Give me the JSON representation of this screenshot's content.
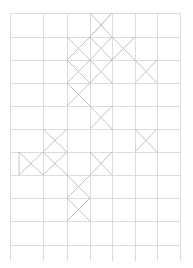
{
  "document": {
    "kind": "grid-pattern-diagram",
    "description": "Faint rectangular grid with diagonal X marks filling selected cells",
    "width": 193,
    "height": 268,
    "background_color": "#ffffff"
  },
  "grid": {
    "line_color": "#d8d8d8",
    "line_width": 0.9,
    "x_positions": [
      10,
      43,
      67,
      90,
      112,
      135,
      157,
      180
    ],
    "y_positions": [
      13,
      37,
      60,
      83,
      106,
      129,
      152,
      175,
      198,
      221,
      245
    ],
    "columns": 7,
    "rows": 10,
    "cell_width_avg": 24,
    "cell_height_avg": 23
  },
  "marks": {
    "diagonal_color": "#bcbcbc",
    "diagonal_width": 0.9,
    "dotted_color": "#b0b0b0",
    "legend_x": "full-x-cell",
    "legend_half": "single-diagonal-cell",
    "legend_triangle": "triangle-cell",
    "cells_full_x": [
      {
        "col": 3,
        "row": 0
      },
      {
        "col": 2,
        "row": 1
      },
      {
        "col": 3,
        "row": 1
      },
      {
        "col": 4,
        "row": 1
      },
      {
        "col": 2,
        "row": 2
      },
      {
        "col": 3,
        "row": 2
      },
      {
        "col": 5,
        "row": 2
      },
      {
        "col": 2,
        "row": 3
      },
      {
        "col": 3,
        "row": 4
      },
      {
        "col": 1,
        "row": 5
      },
      {
        "col": 5,
        "row": 5
      },
      {
        "col": 1,
        "row": 6
      },
      {
        "col": 3,
        "row": 6
      },
      {
        "col": 2,
        "row": 7
      },
      {
        "col": 2,
        "row": 8
      }
    ],
    "cells_single_diagonal": [
      {
        "col": 3,
        "row": 0,
        "dir": "backslash-dotted"
      },
      {
        "col": 4,
        "row": 1,
        "dir": "backslash-dotted"
      },
      {
        "col": 2,
        "row": 8,
        "dir": "backslash-dotted"
      }
    ],
    "triangle_cell": {
      "col": 0,
      "row": 6,
      "orientation": "pointing-right"
    }
  },
  "labels": {
    "title": "",
    "caption": ""
  }
}
